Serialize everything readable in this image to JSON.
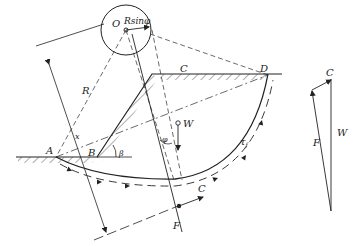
{
  "diagram": {
    "colors": {
      "stroke": "#222222",
      "background": "#ffffff"
    },
    "labels": {
      "O": "O",
      "Rsin": "Rsinφ",
      "R": "R",
      "x": "x",
      "A": "A",
      "B": "B",
      "C": "C",
      "D": "D",
      "beta": "β",
      "phi": "φ",
      "W": "W",
      "tau": "τ",
      "tau_sub": "f",
      "C_force": "C",
      "F_force": "F"
    },
    "force_polygon": {
      "C": "C",
      "F": "F",
      "W": "W"
    }
  }
}
